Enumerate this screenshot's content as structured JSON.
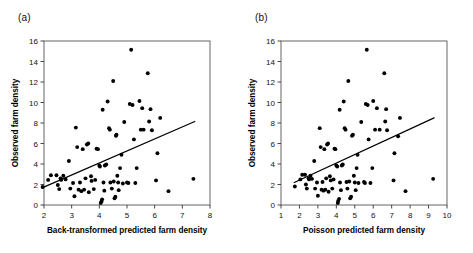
{
  "figure": {
    "panels": [
      {
        "label": "(a)",
        "chart_index": 0
      },
      {
        "label": "(b)",
        "chart_index": 1
      }
    ]
  },
  "chart_data": [
    {
      "type": "scatter",
      "title": "",
      "panel_label": "(a)",
      "xlabel": "Back-transformed predicted farm density",
      "ylabel": "Observed farm density",
      "xlim": [
        2,
        8
      ],
      "ylim": [
        0,
        16
      ],
      "xticks": [
        2,
        3,
        4,
        5,
        6,
        7,
        8
      ],
      "yticks": [
        0,
        2,
        4,
        6,
        8,
        10,
        12,
        14,
        16
      ],
      "grid": false,
      "legend": "none",
      "marker": "filled-circle",
      "marker_color": "#000000",
      "line_color": "#000000",
      "regression_line": {
        "x0": 1.95,
        "y0": 1.7,
        "x1": 7.45,
        "y1": 8.15
      },
      "points": [
        [
          1.95,
          1.75
        ],
        [
          2.15,
          2.45
        ],
        [
          2.25,
          2.9
        ],
        [
          2.45,
          2.9
        ],
        [
          2.5,
          1.95
        ],
        [
          2.55,
          1.55
        ],
        [
          2.6,
          2.6
        ],
        [
          2.62,
          2.45
        ],
        [
          2.7,
          2.85
        ],
        [
          2.78,
          2.5
        ],
        [
          2.9,
          4.3
        ],
        [
          2.95,
          1.6
        ],
        [
          3.05,
          2.15
        ],
        [
          3.1,
          0.85
        ],
        [
          3.15,
          7.55
        ],
        [
          3.2,
          5.65
        ],
        [
          3.25,
          1.5
        ],
        [
          3.3,
          2.2
        ],
        [
          3.35,
          1.35
        ],
        [
          3.4,
          5.45
        ],
        [
          3.45,
          1.5
        ],
        [
          3.5,
          2.6
        ],
        [
          3.55,
          5.9
        ],
        [
          3.6,
          6.0
        ],
        [
          3.62,
          1.25
        ],
        [
          3.7,
          2.8
        ],
        [
          3.72,
          2.35
        ],
        [
          3.8,
          1.55
        ],
        [
          3.85,
          2.45
        ],
        [
          3.9,
          5.5
        ],
        [
          3.95,
          5.45
        ],
        [
          4.0,
          3.85
        ],
        [
          4.02,
          3.75
        ],
        [
          4.05,
          0.2
        ],
        [
          4.08,
          0.35
        ],
        [
          4.1,
          0.55
        ],
        [
          4.12,
          9.3
        ],
        [
          4.15,
          2.2
        ],
        [
          4.18,
          1.4
        ],
        [
          4.2,
          3.85
        ],
        [
          4.25,
          3.95
        ],
        [
          4.3,
          10.1
        ],
        [
          4.35,
          7.5
        ],
        [
          4.38,
          7.35
        ],
        [
          4.4,
          2.2
        ],
        [
          4.45,
          1.6
        ],
        [
          4.5,
          12.1
        ],
        [
          4.52,
          2.3
        ],
        [
          4.55,
          0.65
        ],
        [
          4.58,
          0.8
        ],
        [
          4.6,
          6.75
        ],
        [
          4.62,
          6.85
        ],
        [
          4.65,
          2.85
        ],
        [
          4.68,
          2.2
        ],
        [
          4.7,
          1.45
        ],
        [
          4.75,
          3.6
        ],
        [
          4.8,
          4.9
        ],
        [
          4.85,
          2.1
        ],
        [
          4.9,
          8.1
        ],
        [
          5.0,
          2.2
        ],
        [
          5.05,
          2.15
        ],
        [
          5.1,
          9.85
        ],
        [
          5.15,
          15.15
        ],
        [
          5.2,
          9.75
        ],
        [
          5.25,
          6.4
        ],
        [
          5.3,
          2.15
        ],
        [
          5.35,
          3.6
        ],
        [
          5.45,
          10.15
        ],
        [
          5.5,
          7.35
        ],
        [
          5.55,
          9.45
        ],
        [
          5.6,
          7.35
        ],
        [
          5.75,
          12.85
        ],
        [
          5.8,
          8.15
        ],
        [
          5.85,
          9.35
        ],
        [
          5.9,
          7.3
        ],
        [
          6.05,
          2.4
        ],
        [
          6.1,
          5.05
        ],
        [
          6.2,
          8.5
        ],
        [
          6.5,
          1.35
        ],
        [
          7.4,
          2.55
        ]
      ]
    },
    {
      "type": "scatter",
      "title": "",
      "panel_label": "(b)",
      "xlabel": "Poisson predicted farm density",
      "ylabel": "Observed farm density",
      "xlim": [
        1,
        10
      ],
      "ylim": [
        0,
        16
      ],
      "xticks": [
        1,
        2,
        3,
        4,
        5,
        6,
        7,
        8,
        9,
        10
      ],
      "yticks": [
        0,
        2,
        4,
        6,
        8,
        10,
        12,
        14,
        16
      ],
      "grid": false,
      "legend": "none",
      "marker": "filled-circle",
      "marker_color": "#000000",
      "line_color": "#000000",
      "regression_line": {
        "x0": 1.72,
        "y0": 2.2,
        "x1": 9.3,
        "y1": 8.5
      },
      "points": [
        [
          1.75,
          1.8
        ],
        [
          2.05,
          2.5
        ],
        [
          2.15,
          2.95
        ],
        [
          2.3,
          2.95
        ],
        [
          2.35,
          2.0
        ],
        [
          2.4,
          1.6
        ],
        [
          2.5,
          2.6
        ],
        [
          2.52,
          2.5
        ],
        [
          2.6,
          2.85
        ],
        [
          2.68,
          2.55
        ],
        [
          2.8,
          4.3
        ],
        [
          2.85,
          1.6
        ],
        [
          2.95,
          2.2
        ],
        [
          3.0,
          0.9
        ],
        [
          3.1,
          7.5
        ],
        [
          3.15,
          5.65
        ],
        [
          3.2,
          1.5
        ],
        [
          3.25,
          2.25
        ],
        [
          3.3,
          1.4
        ],
        [
          3.35,
          5.45
        ],
        [
          3.4,
          1.5
        ],
        [
          3.45,
          2.6
        ],
        [
          3.5,
          5.9
        ],
        [
          3.55,
          6.0
        ],
        [
          3.58,
          1.3
        ],
        [
          3.65,
          2.8
        ],
        [
          3.7,
          2.4
        ],
        [
          3.78,
          1.6
        ],
        [
          3.85,
          2.5
        ],
        [
          3.9,
          5.5
        ],
        [
          3.95,
          5.45
        ],
        [
          4.0,
          3.85
        ],
        [
          4.05,
          3.75
        ],
        [
          4.08,
          0.2
        ],
        [
          4.1,
          0.4
        ],
        [
          4.15,
          0.6
        ],
        [
          4.18,
          9.3
        ],
        [
          4.2,
          2.2
        ],
        [
          4.25,
          1.45
        ],
        [
          4.3,
          3.85
        ],
        [
          4.35,
          3.95
        ],
        [
          4.4,
          10.1
        ],
        [
          4.45,
          7.5
        ],
        [
          4.5,
          7.35
        ],
        [
          4.55,
          2.25
        ],
        [
          4.6,
          1.6
        ],
        [
          4.65,
          12.1
        ],
        [
          4.7,
          2.3
        ],
        [
          4.75,
          0.65
        ],
        [
          4.8,
          0.8
        ],
        [
          4.85,
          6.75
        ],
        [
          4.9,
          6.85
        ],
        [
          4.95,
          2.85
        ],
        [
          5.0,
          2.2
        ],
        [
          5.05,
          1.45
        ],
        [
          5.1,
          3.6
        ],
        [
          5.15,
          4.9
        ],
        [
          5.2,
          2.15
        ],
        [
          5.35,
          8.1
        ],
        [
          5.5,
          2.25
        ],
        [
          5.55,
          2.15
        ],
        [
          5.6,
          9.85
        ],
        [
          5.65,
          15.15
        ],
        [
          5.7,
          9.75
        ],
        [
          5.75,
          6.4
        ],
        [
          5.85,
          2.15
        ],
        [
          5.95,
          3.6
        ],
        [
          6.0,
          10.15
        ],
        [
          6.1,
          7.35
        ],
        [
          6.2,
          9.45
        ],
        [
          6.35,
          7.35
        ],
        [
          6.6,
          12.85
        ],
        [
          6.65,
          8.15
        ],
        [
          6.7,
          9.35
        ],
        [
          6.75,
          7.3
        ],
        [
          7.1,
          2.4
        ],
        [
          7.15,
          5.05
        ],
        [
          7.35,
          6.7
        ],
        [
          7.45,
          8.5
        ],
        [
          7.75,
          1.35
        ],
        [
          9.25,
          2.55
        ]
      ]
    }
  ]
}
